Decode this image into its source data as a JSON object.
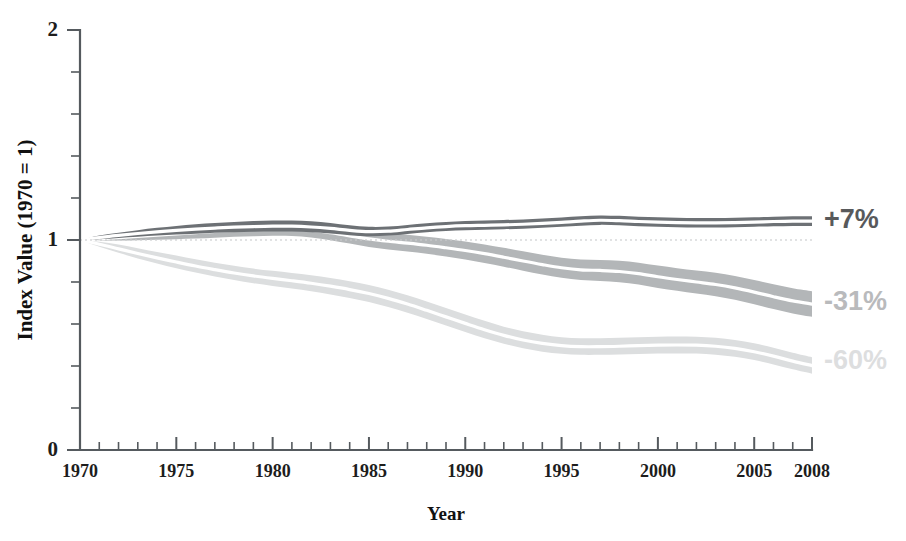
{
  "chart_data": {
    "type": "area",
    "title": "",
    "subtitle": "",
    "xlabel": "Year",
    "ylabel": "Index Value (1970 = 1)",
    "xlim": [
      1970,
      2008
    ],
    "ylim": [
      0,
      2
    ],
    "grid": false,
    "legend_position": "right-inline-annotations",
    "y_major_ticks": [
      0,
      1,
      2
    ],
    "y_major_tick_labels": [
      "0",
      "1",
      "2"
    ],
    "y_minor_tick_step": 0.2,
    "x_major_ticks": [
      1970,
      1975,
      1980,
      1985,
      1990,
      1995,
      2000,
      2005,
      2008
    ],
    "x_major_tick_labels": [
      "1970",
      "1975",
      "1980",
      "1985",
      "1990",
      "1995",
      "2000",
      "2005",
      "2008"
    ],
    "x_minor_tick_step": 1,
    "x": [
      1970,
      1971,
      1972,
      1973,
      1974,
      1975,
      1976,
      1977,
      1978,
      1979,
      1980,
      1981,
      1982,
      1983,
      1984,
      1985,
      1986,
      1987,
      1988,
      1989,
      1990,
      1991,
      1992,
      1993,
      1994,
      1995,
      1996,
      1997,
      1998,
      1999,
      2000,
      2001,
      2002,
      2003,
      2004,
      2005,
      2006,
      2007,
      2008
    ],
    "series": [
      {
        "name": "Top series",
        "annotation": "+7%",
        "color": "#6d7175",
        "band_color": "#6d7175",
        "median_color": "#ffffff",
        "annotation_color": "#58595b",
        "final_value": 1.07,
        "values": [
          1.0,
          1.012,
          1.022,
          1.031,
          1.039,
          1.046,
          1.052,
          1.057,
          1.061,
          1.064,
          1.066,
          1.066,
          1.062,
          1.055,
          1.046,
          1.04,
          1.042,
          1.05,
          1.058,
          1.064,
          1.068,
          1.07,
          1.072,
          1.075,
          1.079,
          1.084,
          1.09,
          1.094,
          1.092,
          1.088,
          1.085,
          1.083,
          1.082,
          1.082,
          1.083,
          1.085,
          1.088,
          1.09,
          1.09
        ],
        "lower": [
          1.0,
          1.004,
          1.01,
          1.016,
          1.021,
          1.026,
          1.03,
          1.034,
          1.037,
          1.039,
          1.04,
          1.04,
          1.037,
          1.031,
          1.023,
          1.018,
          1.021,
          1.029,
          1.037,
          1.043,
          1.047,
          1.049,
          1.051,
          1.054,
          1.058,
          1.063,
          1.068,
          1.072,
          1.07,
          1.066,
          1.063,
          1.061,
          1.06,
          1.06,
          1.061,
          1.063,
          1.065,
          1.067,
          1.067
        ],
        "upper": [
          1.0,
          1.021,
          1.035,
          1.047,
          1.058,
          1.067,
          1.075,
          1.081,
          1.086,
          1.09,
          1.093,
          1.093,
          1.089,
          1.081,
          1.07,
          1.063,
          1.064,
          1.072,
          1.08,
          1.086,
          1.091,
          1.093,
          1.095,
          1.098,
          1.102,
          1.107,
          1.113,
          1.117,
          1.115,
          1.111,
          1.108,
          1.106,
          1.105,
          1.105,
          1.106,
          1.108,
          1.111,
          1.113,
          1.113
        ]
      },
      {
        "name": "Middle series",
        "annotation": "-31%",
        "color": "#b3b6b8",
        "band_color": "#b3b6b8",
        "median_color": "#ffffff",
        "annotation_color": "#b9babc",
        "final_value": 0.69,
        "values": [
          1.0,
          1.005,
          1.011,
          1.017,
          1.023,
          1.029,
          1.035,
          1.041,
          1.046,
          1.05,
          1.053,
          1.053,
          1.047,
          1.035,
          1.02,
          1.005,
          0.994,
          0.985,
          0.975,
          0.963,
          0.95,
          0.935,
          0.918,
          0.9,
          0.883,
          0.868,
          0.858,
          0.855,
          0.85,
          0.84,
          0.825,
          0.812,
          0.8,
          0.788,
          0.772,
          0.752,
          0.73,
          0.71,
          0.695
        ],
        "lower": [
          1.0,
          0.998,
          0.998,
          0.999,
          1.001,
          1.004,
          1.007,
          1.011,
          1.015,
          1.018,
          1.02,
          1.019,
          1.012,
          0.999,
          0.983,
          0.967,
          0.955,
          0.945,
          0.934,
          0.921,
          0.907,
          0.891,
          0.873,
          0.854,
          0.836,
          0.82,
          0.809,
          0.805,
          0.799,
          0.788,
          0.772,
          0.758,
          0.745,
          0.732,
          0.715,
          0.694,
          0.671,
          0.65,
          0.634
        ],
        "upper": [
          1.0,
          1.012,
          1.024,
          1.035,
          1.045,
          1.054,
          1.063,
          1.071,
          1.077,
          1.082,
          1.086,
          1.087,
          1.082,
          1.071,
          1.057,
          1.043,
          1.033,
          1.025,
          1.016,
          1.005,
          0.993,
          0.979,
          0.963,
          0.946,
          0.93,
          0.916,
          0.907,
          0.905,
          0.901,
          0.892,
          0.878,
          0.866,
          0.855,
          0.844,
          0.829,
          0.81,
          0.789,
          0.77,
          0.756
        ]
      },
      {
        "name": "Bottom series",
        "annotation": "-60%",
        "color": "#dcdedf",
        "band_color": "#dcdedf",
        "median_color": "#ffffff",
        "annotation_color": "#dddedf",
        "final_value": 0.4,
        "values": [
          1.0,
          0.98,
          0.958,
          0.936,
          0.915,
          0.895,
          0.876,
          0.859,
          0.843,
          0.829,
          0.817,
          0.806,
          0.794,
          0.78,
          0.764,
          0.745,
          0.722,
          0.695,
          0.665,
          0.634,
          0.603,
          0.573,
          0.546,
          0.524,
          0.508,
          0.497,
          0.492,
          0.492,
          0.494,
          0.497,
          0.499,
          0.5,
          0.499,
          0.494,
          0.484,
          0.468,
          0.447,
          0.423,
          0.402
        ],
        "lower": [
          1.0,
          0.968,
          0.939,
          0.912,
          0.888,
          0.865,
          0.845,
          0.826,
          0.809,
          0.794,
          0.781,
          0.769,
          0.756,
          0.741,
          0.724,
          0.705,
          0.681,
          0.654,
          0.624,
          0.593,
          0.562,
          0.532,
          0.506,
          0.484,
          0.468,
          0.458,
          0.453,
          0.453,
          0.455,
          0.457,
          0.459,
          0.46,
          0.459,
          0.454,
          0.444,
          0.428,
          0.407,
          0.384,
          0.363
        ],
        "upper": [
          1.0,
          0.992,
          0.978,
          0.961,
          0.943,
          0.926,
          0.908,
          0.892,
          0.877,
          0.864,
          0.853,
          0.843,
          0.832,
          0.819,
          0.804,
          0.786,
          0.763,
          0.737,
          0.707,
          0.676,
          0.645,
          0.615,
          0.587,
          0.565,
          0.549,
          0.537,
          0.532,
          0.532,
          0.534,
          0.537,
          0.539,
          0.54,
          0.539,
          0.534,
          0.524,
          0.508,
          0.487,
          0.463,
          0.442
        ]
      }
    ],
    "baseline_reference": {
      "value": 1.0,
      "style": "dotted",
      "color": "#c9cbcc"
    }
  },
  "annotations": [
    {
      "id": "annotation-top",
      "text": "+7%",
      "value": 1.09,
      "color": "#58595b"
    },
    {
      "id": "annotation-middle",
      "text": "-31%",
      "value": 0.7,
      "color": "#b9babc"
    },
    {
      "id": "annotation-bottom",
      "text": "-60%",
      "value": 0.42,
      "color": "#dddedf"
    }
  ]
}
